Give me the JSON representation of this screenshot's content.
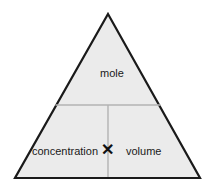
{
  "diagram": {
    "type": "formula-triangle",
    "shape": "triangle",
    "title": "",
    "colors": {
      "background": "#ffffff",
      "fill": "#ebebeb",
      "outline": "#1a1a1a",
      "divider": "#b3b3b3",
      "text": "#1a1a1a"
    },
    "geometry": {
      "apex": [
        108,
        14
      ],
      "bottom_left": [
        15,
        178
      ],
      "bottom_right": [
        200,
        178
      ],
      "horizontal_divider_y": 105,
      "vertical_divider_x": 108
    },
    "cells": {
      "top": {
        "label": "mole",
        "position": "top"
      },
      "bottom_left": {
        "label": "concentration",
        "position": "bottom-left"
      },
      "bottom_right": {
        "label": "volume",
        "position": "bottom-right"
      }
    },
    "operator": {
      "symbol": "✕",
      "name": "multiply-symbol",
      "between": [
        "concentration",
        "volume"
      ]
    }
  }
}
